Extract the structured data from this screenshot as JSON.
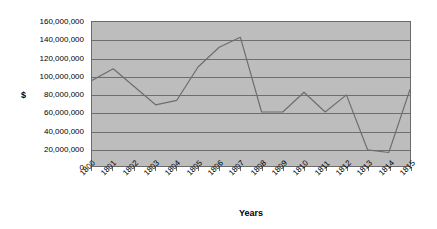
{
  "chart_data": {
    "type": "line",
    "title": "",
    "xlabel": "Years",
    "ylabel": "$",
    "categories": [
      "1800",
      "1801",
      "1802",
      "1803",
      "1804",
      "1805",
      "1806",
      "1807",
      "1808",
      "1809",
      "1810",
      "1811",
      "1812",
      "1813",
      "1814",
      "1815"
    ],
    "values": [
      95000000,
      108000000,
      88000000,
      68000000,
      73000000,
      110000000,
      132000000,
      143000000,
      60000000,
      60000000,
      82000000,
      60000000,
      79000000,
      18000000,
      15000000,
      85000000
    ],
    "series": [
      {
        "name": "$",
        "values": [
          95000000,
          108000000,
          88000000,
          68000000,
          73000000,
          110000000,
          132000000,
          143000000,
          60000000,
          60000000,
          82000000,
          60000000,
          79000000,
          18000000,
          15000000,
          85000000
        ]
      }
    ],
    "ylim": [
      0,
      160000000
    ],
    "ytick_step": 20000000,
    "ytick_labels": [
      "160,000,000",
      "140,000,000",
      "120,000,000",
      "100,000,000",
      "80,000,000",
      "60,000,000",
      "40,000,000",
      "20,000,000",
      "0"
    ],
    "ytick_values": [
      160000000,
      140000000,
      120000000,
      100000000,
      80000000,
      60000000,
      40000000,
      20000000,
      0
    ],
    "grid": true,
    "grid_orientation": "horizontal",
    "legend": false,
    "legend_position": "none",
    "colors": {
      "plot_background": "#bdbdbd",
      "page_background": "#ffffff",
      "gridline": "#6e6e6e",
      "axis_line": "#6b6b6b",
      "series_line": "#6e6e6e",
      "text": "#000000"
    }
  }
}
